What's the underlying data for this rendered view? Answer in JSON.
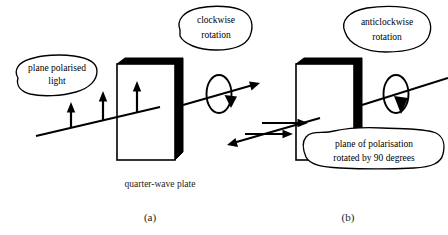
{
  "figure": {
    "panels": [
      {
        "id": "a",
        "label": "(a)",
        "caption": "quarter-wave plate",
        "input_callout": "plane polarised light",
        "rotation_callout": "clockwise rotation",
        "rotation_callout_line1": "clockwise",
        "rotation_callout_line2": "rotation",
        "input_callout_line1": "plane polarised",
        "input_callout_line2": "light",
        "polarisation_state": "vertical",
        "arrow_count": 3
      },
      {
        "id": "b",
        "label": "(b)",
        "caption": "",
        "output_callout": "plane of polarisation rotated by 90 degrees",
        "output_callout_line1": "plane of polarisation",
        "output_callout_line2": "rotated by 90 degrees",
        "rotation_callout": "anticlockwise rotation",
        "rotation_callout_line1": "anticlockwise",
        "rotation_callout_line2": "rotation",
        "polarisation_state": "horizontal",
        "arrow_count": 2
      }
    ],
    "colors": {
      "ink": "#000000",
      "paper": "#ffffff",
      "caption_ink": "#1a1a1a"
    }
  }
}
